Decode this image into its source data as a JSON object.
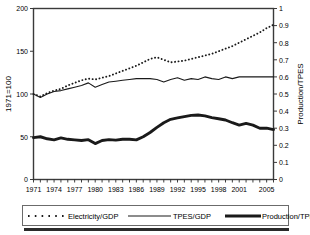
{
  "chart_data": {
    "type": "line",
    "title": "",
    "xlabel": "",
    "ylabel": "1971=100",
    "y2label": "Production/TPES",
    "grid": false,
    "legend_position": "bottom",
    "xlim": [
      1971,
      2006
    ],
    "ylim": [
      0,
      200
    ],
    "y2lim": [
      0,
      1
    ],
    "yticks": [
      0,
      50,
      100,
      150,
      200
    ],
    "y2ticks": [
      0,
      0.1,
      0.2,
      0.3,
      0.4,
      0.5,
      0.6,
      0.7,
      0.8,
      0.9,
      1
    ],
    "y2ticklabels": [
      "0",
      "0.1",
      "0.2",
      "0.3",
      "0.4",
      "0.5",
      "0.6",
      "0.7",
      "0.8",
      "0.9",
      "1"
    ],
    "xticklabels": [
      "1971",
      "1974",
      "1977",
      "1980",
      "1983",
      "1986",
      "1989",
      "1992",
      "1995",
      "1998",
      "2001",
      "2005"
    ],
    "xticklabel_years": [
      1971,
      1974,
      1977,
      1980,
      1983,
      1986,
      1989,
      1992,
      1995,
      1998,
      2001,
      2005
    ],
    "x": [
      1971,
      1972,
      1973,
      1974,
      1975,
      1976,
      1977,
      1978,
      1979,
      1980,
      1981,
      1982,
      1983,
      1984,
      1985,
      1986,
      1987,
      1988,
      1989,
      1990,
      1991,
      1992,
      1993,
      1994,
      1995,
      1996,
      1997,
      1998,
      1999,
      2000,
      2001,
      2002,
      2003,
      2004,
      2005,
      2006
    ],
    "series": [
      {
        "name": "Electricity/GDP",
        "axis": "left",
        "style": "dotted",
        "color": "#1a1a1a",
        "values": [
          100,
          97,
          101,
          104,
          106,
          110,
          113,
          116,
          118,
          117,
          119,
          121,
          124,
          127,
          130,
          133,
          137,
          141,
          143,
          140,
          137,
          138,
          139,
          141,
          143,
          145,
          147,
          150,
          153,
          156,
          160,
          164,
          168,
          172,
          177,
          181
        ]
      },
      {
        "name": "TPES/GDP",
        "axis": "left",
        "style": "solid-thin",
        "color": "#1a1a1a",
        "values": [
          100,
          96,
          100,
          103,
          104,
          106,
          108,
          110,
          113,
          108,
          111,
          114,
          115,
          116,
          117,
          118,
          118,
          118,
          117,
          114,
          117,
          119,
          116,
          118,
          117,
          120,
          118,
          117,
          120,
          118,
          120,
          120,
          120,
          120,
          120,
          120
        ]
      },
      {
        "name": "Production/TPES",
        "axis": "right",
        "style": "solid-thick",
        "color": "#1a1a1a",
        "values": [
          0.245,
          0.25,
          0.238,
          0.232,
          0.243,
          0.235,
          0.232,
          0.228,
          0.233,
          0.21,
          0.228,
          0.233,
          0.23,
          0.235,
          0.235,
          0.232,
          0.25,
          0.275,
          0.305,
          0.332,
          0.352,
          0.36,
          0.368,
          0.375,
          0.377,
          0.372,
          0.362,
          0.355,
          0.348,
          0.332,
          0.318,
          0.328,
          0.318,
          0.3,
          0.3,
          0.292
        ]
      }
    ]
  },
  "legend": {
    "items": [
      {
        "label": "Electricity/GDP",
        "marker": "dotted"
      },
      {
        "label": "TPES/GDP",
        "marker": "solid-thin"
      },
      {
        "label": "Production/TPES",
        "marker": "solid-thick"
      }
    ]
  }
}
